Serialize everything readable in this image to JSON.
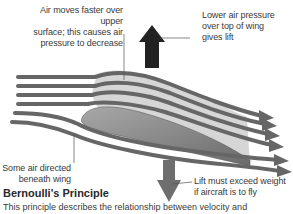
{
  "labels": {
    "upper_surface": [
      "Air moves faster over upper",
      "surface; this causes air",
      "pressure to decrease"
    ],
    "lower_pressure": [
      "Lower air pressure",
      "over top of wing",
      "gives lift"
    ],
    "beneath_wing": [
      "Some air directed",
      "beneath wing"
    ],
    "lift_weight": [
      "Lift must exceed weight",
      "if aircraft is to fly"
    ]
  },
  "section": {
    "title": "Bernoulli's Principle",
    "body": "This principle describes the relationship between velocity and"
  },
  "colors": {
    "airflow": "#6a6a6a",
    "wing_top": "#c8c8c8",
    "wing_bottom": "#8a8a8a",
    "lift_arrow": "#222222",
    "weight_arrow": "#6e6e6e",
    "leader_line": "#555555"
  }
}
